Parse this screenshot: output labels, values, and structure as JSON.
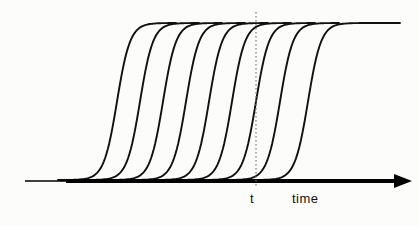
{
  "figure": {
    "background_color": "#fcfcfb",
    "stroke_color": "#111111",
    "axis_color": "#000000",
    "dotted_line_color": "#777777"
  },
  "axis": {
    "name": "time-axis",
    "label": "time",
    "label_x": 292,
    "label_y": 192,
    "y": 181,
    "x_start": 25,
    "x_end": 398,
    "thin_start": 25,
    "thick_start": 66,
    "thin_width": 1.6,
    "thick_width": 4.2,
    "arrow_tip_x": 412,
    "arrow_half_height": 7,
    "arrow_back_x": 394
  },
  "marker": {
    "name": "reference-time-marker",
    "label": "t",
    "x": 256,
    "label_x": 250,
    "label_y": 192,
    "y_top": 12,
    "y_bottom": 186,
    "dash": "1.5 2.5",
    "width": 1.2
  },
  "chart_data": {
    "type": "line",
    "title": "",
    "xlabel": "time",
    "ylabel": "",
    "xlim": [
      0,
      419
    ],
    "ylim": [
      0,
      226
    ],
    "grid": false,
    "legend": false,
    "annotations": [
      {
        "text": "t",
        "x": 256,
        "y": 200,
        "kind": "axis-tick-label"
      },
      {
        "text": "time",
        "x": 311,
        "y": 200,
        "kind": "axis-title"
      }
    ],
    "curve_shape": "sigmoid",
    "curve_count": 9,
    "baseline_y": 180,
    "plateau_y": 23,
    "curve_width": 118,
    "series": [
      {
        "name": "curve-1",
        "midpoint_x": 117,
        "start_x": 58,
        "end_x": 176,
        "values": [
          180,
          179,
          176,
          168,
          150,
          120,
          90,
          62,
          42,
          30,
          25,
          23,
          23
        ]
      },
      {
        "name": "curve-2",
        "midpoint_x": 140,
        "start_x": 81,
        "end_x": 199,
        "values": [
          180,
          179,
          176,
          168,
          150,
          120,
          90,
          62,
          42,
          30,
          25,
          23,
          23
        ]
      },
      {
        "name": "curve-3",
        "midpoint_x": 163,
        "start_x": 104,
        "end_x": 222,
        "values": [
          180,
          179,
          176,
          168,
          150,
          120,
          90,
          62,
          42,
          30,
          25,
          23,
          23
        ]
      },
      {
        "name": "curve-4",
        "midpoint_x": 186,
        "start_x": 127,
        "end_x": 245,
        "values": [
          180,
          179,
          176,
          168,
          150,
          120,
          90,
          62,
          42,
          30,
          25,
          23,
          23
        ]
      },
      {
        "name": "curve-5",
        "midpoint_x": 209,
        "start_x": 150,
        "end_x": 268,
        "values": [
          180,
          179,
          176,
          168,
          150,
          120,
          90,
          62,
          42,
          30,
          25,
          23,
          23
        ]
      },
      {
        "name": "curve-6",
        "midpoint_x": 232,
        "start_x": 173,
        "end_x": 291,
        "values": [
          180,
          179,
          176,
          168,
          150,
          120,
          90,
          62,
          42,
          30,
          25,
          23,
          23
        ]
      },
      {
        "name": "curve-7",
        "midpoint_x": 256,
        "start_x": 197,
        "end_x": 315,
        "values": [
          180,
          179,
          176,
          168,
          150,
          120,
          90,
          62,
          42,
          30,
          25,
          23,
          23
        ]
      },
      {
        "name": "curve-8",
        "midpoint_x": 280,
        "start_x": 221,
        "end_x": 339,
        "values": [
          180,
          179,
          176,
          168,
          150,
          120,
          90,
          62,
          42,
          30,
          25,
          23,
          23
        ]
      },
      {
        "name": "curve-9",
        "midpoint_x": 308,
        "start_x": 249,
        "end_x": 400,
        "values": [
          180,
          179,
          176,
          168,
          150,
          120,
          90,
          62,
          42,
          30,
          25,
          23,
          23
        ]
      }
    ]
  }
}
